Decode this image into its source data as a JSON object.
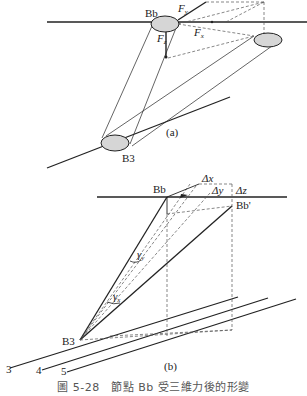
{
  "figure": {
    "caption": "圖 5-28　節點 Bb 受三維力後的形變",
    "colors": {
      "line": "#222222",
      "node_fill": "#d6d6d6",
      "dashed": "#555555"
    }
  },
  "part_a": {
    "label": "(a)",
    "node_top": "Bb",
    "node_bottom": "B3",
    "forces": {
      "fy": "F",
      "fy_sub": "y",
      "fx": "F",
      "fx_sub": "x",
      "fz": "F",
      "fz_sub": "z"
    }
  },
  "part_b": {
    "label": "(b)",
    "node_top": "Bb",
    "node_displaced": "Bb'",
    "node_bottom": "B3",
    "deltas": {
      "dx": "Δx",
      "dy": "Δy",
      "dz": "Δz"
    },
    "angles": {
      "gamma_y": "γ",
      "gamma_y_sub": "y",
      "gamma_x": "γ",
      "gamma_x_sub": "x"
    },
    "members": [
      "3",
      "4",
      "5"
    ]
  }
}
